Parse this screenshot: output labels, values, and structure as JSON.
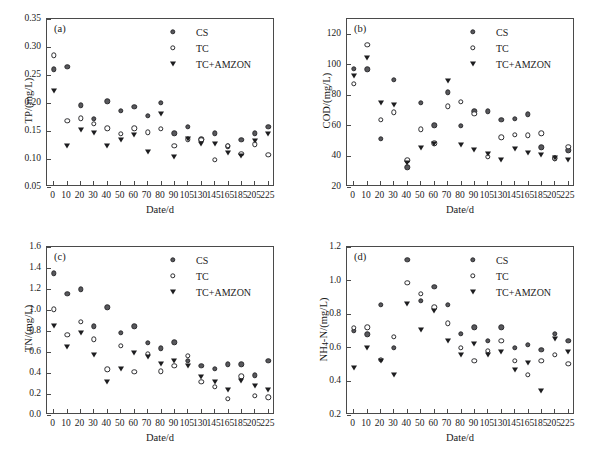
{
  "figure": {
    "xlabel": "Date/d",
    "categories": [
      "0",
      "10",
      "20",
      "30",
      "40",
      "50",
      "60",
      "70",
      "80",
      "90",
      "105",
      "130",
      "145",
      "165",
      "185",
      "205",
      "225"
    ],
    "legend": [
      {
        "key": "CS",
        "label": "CS",
        "marker": "filled-circle"
      },
      {
        "key": "TC",
        "label": "TC",
        "marker": "open-circle"
      },
      {
        "key": "TC+AMZON",
        "label": "TC+AMZON",
        "marker": "filled-triangle-down"
      }
    ],
    "colors": {
      "cs": "#58585c",
      "tc": "#ffffff",
      "amzon": "#1d1d1f",
      "axis": "#4a4a4a"
    }
  },
  "chart_data": [
    {
      "type": "scatter",
      "panel": "(a)",
      "title": "",
      "xlabel": "Date/d",
      "ylabel": "TP/(mg/L)",
      "ylim": [
        0.05,
        0.35
      ],
      "yticks": [
        "0.05",
        "0.10",
        "0.15",
        "0.20",
        "0.25",
        "0.30",
        "0.35"
      ],
      "grid": false,
      "legend_position": "top-right",
      "x": [
        "0",
        "10",
        "20",
        "30",
        "40",
        "50",
        "60",
        "70",
        "80",
        "90",
        "105",
        "130",
        "145",
        "165",
        "185",
        "205",
        "225"
      ],
      "series": [
        {
          "name": "CS",
          "values": [
            0.26,
            0.265,
            0.196,
            0.172,
            0.203,
            0.186,
            0.193,
            0.177,
            0.2,
            0.146,
            0.158,
            0.135,
            0.146,
            0.123,
            0.134,
            0.146,
            0.158
          ]
        },
        {
          "name": "TC",
          "values": [
            0.285,
            0.168,
            0.173,
            0.163,
            0.155,
            0.145,
            0.155,
            0.148,
            0.154,
            0.124,
            0.135,
            0.134,
            0.099,
            0.124,
            0.109,
            0.126,
            0.108
          ]
        },
        {
          "name": "TC+AMZON",
          "values": [
            0.221,
            0.124,
            0.152,
            0.146,
            0.124,
            0.134,
            0.142,
            0.112,
            0.18,
            0.104,
            0.135,
            0.126,
            0.126,
            0.111,
            0.105,
            0.133,
            0.145
          ]
        }
      ]
    },
    {
      "type": "scatter",
      "panel": "(b)",
      "title": "",
      "xlabel": "Date/d",
      "ylabel": "COD/(mg/L)",
      "ylim": [
        20,
        130
      ],
      "yticks": [
        "20",
        "40",
        "60",
        "80",
        "100",
        "120"
      ],
      "grid": false,
      "legend_position": "top-right",
      "x": [
        "0",
        "10",
        "20",
        "30",
        "40",
        "50",
        "60",
        "70",
        "80",
        "90",
        "105",
        "130",
        "145",
        "165",
        "185",
        "205",
        "225"
      ],
      "series": [
        {
          "name": "CS",
          "values": [
            97.5,
            97.0,
            51.5,
            90.0,
            33.0,
            75.0,
            60.3,
            82.0,
            60.2,
            69.5,
            69.5,
            63.8,
            64.5,
            67.5,
            46.0,
            38.8,
            44.0
          ]
        },
        {
          "name": "TC",
          "values": [
            87.5,
            113.0,
            63.8,
            68.8,
            37.5,
            57.8,
            48.5,
            72.8,
            75.8,
            68.0,
            39.8,
            52.5,
            54.0,
            53.8,
            55.2,
            38.8,
            46.2
          ]
        },
        {
          "name": "TC+AMZON",
          "values": [
            93.0,
            104.5,
            74.8,
            74.0,
            35.5,
            45.5,
            48.2,
            89.5,
            47.2,
            44.5,
            41.5,
            38.0,
            44.8,
            42.5,
            40.8,
            38.8,
            38.0
          ]
        }
      ]
    },
    {
      "type": "scatter",
      "panel": "(c)",
      "title": "",
      "xlabel": "Date/d",
      "ylabel": "TN/(mg/L)",
      "ylim": [
        0.0,
        1.6
      ],
      "yticks": [
        "0.0",
        "0.2",
        "0.4",
        "0.6",
        "0.8",
        "1.0",
        "1.2",
        "1.4",
        "1.6"
      ],
      "grid": false,
      "legend_position": "top-right",
      "x": [
        "0",
        "10",
        "20",
        "30",
        "40",
        "50",
        "60",
        "70",
        "80",
        "90",
        "105",
        "130",
        "145",
        "165",
        "185",
        "205",
        "225"
      ],
      "series": [
        {
          "name": "CS",
          "values": [
            1.35,
            1.155,
            1.198,
            0.843,
            1.025,
            0.782,
            0.843,
            0.687,
            0.637,
            0.693,
            0.517,
            0.468,
            0.44,
            0.482,
            0.482,
            0.377,
            0.517
          ]
        },
        {
          "name": "TC",
          "values": [
            1.007,
            0.762,
            0.888,
            0.72,
            0.437,
            0.66,
            0.412,
            0.583,
            0.418,
            0.468,
            0.562,
            0.315,
            0.27,
            0.152,
            0.37,
            0.18,
            0.17
          ]
        },
        {
          "name": "TC+AMZON",
          "values": [
            0.843,
            0.645,
            0.78,
            0.567,
            0.315,
            0.437,
            0.593,
            0.553,
            0.487,
            0.517,
            0.468,
            0.358,
            0.315,
            0.238,
            0.325,
            0.275,
            0.238
          ]
        }
      ]
    },
    {
      "type": "scatter",
      "panel": "(d)",
      "title": "",
      "xlabel": "Date/d",
      "ylabel": "NH4-N/(mg/L)",
      "ylim": [
        0.2,
        1.2
      ],
      "yticks": [
        "0.2",
        "0.4",
        "0.6",
        "0.8",
        "1.0",
        "1.2"
      ],
      "grid": false,
      "legend_position": "top-right",
      "x": [
        "0",
        "10",
        "20",
        "30",
        "40",
        "50",
        "60",
        "70",
        "80",
        "90",
        "105",
        "130",
        "145",
        "165",
        "185",
        "205",
        "225"
      ],
      "series": [
        {
          "name": "CS",
          "values": [
            0.7,
            0.68,
            0.855,
            0.6,
            1.125,
            0.88,
            0.963,
            0.855,
            0.682,
            0.723,
            0.643,
            0.723,
            0.6,
            0.617,
            0.587,
            0.685,
            0.64
          ]
        },
        {
          "name": "TC",
          "values": [
            0.718,
            0.723,
            0.528,
            0.665,
            0.987,
            0.922,
            0.84,
            0.745,
            0.6,
            0.522,
            0.583,
            0.64,
            0.522,
            0.44,
            0.522,
            0.56,
            0.505
          ]
        },
        {
          "name": "TC+AMZON",
          "values": [
            0.48,
            0.6,
            0.52,
            0.44,
            0.862,
            0.707,
            0.822,
            0.64,
            0.56,
            0.625,
            0.555,
            0.573,
            0.47,
            0.512,
            0.345,
            0.652,
            0.573
          ]
        }
      ]
    }
  ]
}
